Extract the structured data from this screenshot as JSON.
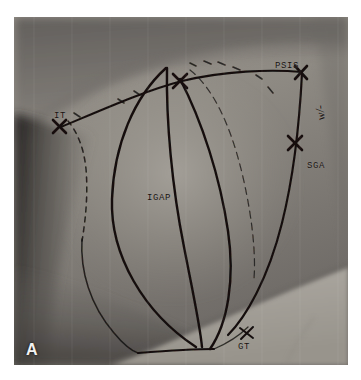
{
  "figure": {
    "panel_letter": "A",
    "domain_note": "clinical photograph of gluteal region with surgical skin markings"
  },
  "annotations": {
    "psis": "PSIS",
    "it": "IT",
    "sga": "SGA",
    "igap": "IGAP",
    "gt": "GT",
    "scribble": "w/-"
  },
  "colors": {
    "ink": "#17120f",
    "skin_mid": "#8f8b85",
    "skin_light": "#b9b5ae",
    "skin_shadow": "#4a4744",
    "page_background": "#ffffff",
    "panel_letter": "#f2f2f2"
  },
  "markings": {
    "x_marks": [
      {
        "name": "psis-x-mark",
        "cx": 286,
        "cy": 55
      },
      {
        "name": "it-x-mark",
        "cx": 45,
        "cy": 109
      },
      {
        "name": "sga-x-mark",
        "cx": 281,
        "cy": 126
      },
      {
        "name": "apex-x-mark",
        "cx": 166,
        "cy": 64
      },
      {
        "name": "gt-x-mark",
        "cx": 232,
        "cy": 317
      }
    ],
    "solid_curves": 4,
    "dashed_curves": 2
  }
}
